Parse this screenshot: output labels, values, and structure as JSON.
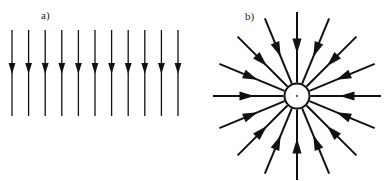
{
  "figure": {
    "background_color": "#ffffff",
    "stroke_color": "#111111",
    "width": 392,
    "height": 181
  },
  "panels": [
    {
      "id": "a",
      "label": "a)",
      "label_x": 41,
      "label_y": 10,
      "kind": "uniform-field",
      "description": "Uniform downward-pointing vector field",
      "arrow_count": 11,
      "arrow_direction": "down",
      "field_type": "uniform",
      "geometry": {
        "x_start": 12,
        "x_spacing": 16.6,
        "y_top": 30,
        "y_bottom": 116,
        "head_y": 74,
        "shaft_width": 1.3,
        "head_half_width": 3.4,
        "head_length": 11
      }
    },
    {
      "id": "b",
      "label": "b)",
      "label_x": 49,
      "label_y": 11,
      "kind": "radial-field",
      "description": "Radially convergent vector field pointing inward to a central circle",
      "arrow_count": 16,
      "arrow_direction": "inward",
      "field_type": "radial-convergent",
      "angle_step_degrees": 22.5,
      "geometry": {
        "center_x": 101,
        "center_y": 96,
        "circle_radius": 12.5,
        "circle_stroke_width": 2.0,
        "center_dot_radius": 0.9,
        "tail_radius": 84,
        "head_tip_radius": 16,
        "head_position_fraction": 0.42,
        "shaft_width": 2.0,
        "head_half_width": 4.6,
        "head_length": 15
      },
      "center_marker": {
        "shape": "circle",
        "fill": "#ffffff",
        "has_center_dot": true
      }
    }
  ]
}
